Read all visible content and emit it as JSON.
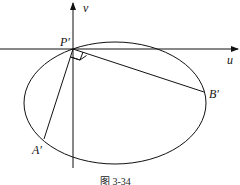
{
  "diagram": {
    "axes": {
      "horizontal_label": "u",
      "vertical_label": "v"
    },
    "points": {
      "P": "P′",
      "A": "A′",
      "B": "B′"
    },
    "caption": "图 3-34",
    "colors": {
      "stroke": "#111111",
      "background": "#ffffff"
    }
  }
}
